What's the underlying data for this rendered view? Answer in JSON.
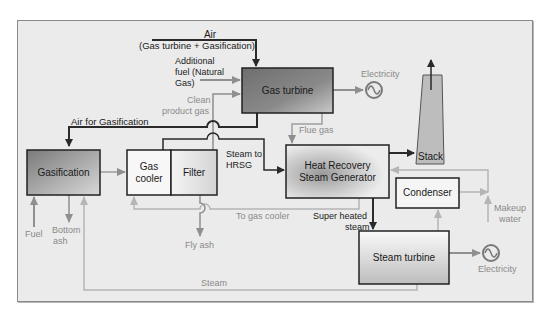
{
  "diagram": {
    "type": "process-flow",
    "colors": {
      "background": "#ebebeb",
      "dark_line": "#2a2a2a",
      "gray_line": "#9e9e9e",
      "gas_turbine_fill": "#7a7a7a",
      "gasification_fill": "#8c8c8c"
    },
    "nodes": {
      "gas_turbine": "Gas turbine",
      "gasification": "Gasification",
      "gas_cooler": "Gas cooler",
      "filter": "Filter",
      "hrsg": "Heat Recovery Steam Generator",
      "stack": "Stack",
      "condenser": "Condenser",
      "steam_turbine": "Steam turbine"
    },
    "labels": {
      "air": "Air",
      "air_sub": "(Gas turbine + Gasification)",
      "additional_fuel_1": "Additional",
      "additional_fuel_2": "fuel (Natural",
      "additional_fuel_3": "Gas)",
      "clean_gas_1": "Clean",
      "clean_gas_2": "product gas",
      "air_for_gasification": "Air for Gasification",
      "electricity_top": "Electricity",
      "flue_gas": "Flue gas",
      "steam_to_hrsg_1": "Steam to",
      "steam_to_hrsg_2": "HRSG",
      "to_gas_cooler": "To gas cooler",
      "super_heated_1": "Super heated",
      "super_heated_2": "steam",
      "makeup_1": "Makeup",
      "makeup_2": "water",
      "electricity_bottom": "Electricity",
      "fuel": "Fuel",
      "bottom_ash_1": "Bottom",
      "bottom_ash_2": "ash",
      "fly_ash": "Fly ash",
      "steam": "Steam"
    }
  }
}
